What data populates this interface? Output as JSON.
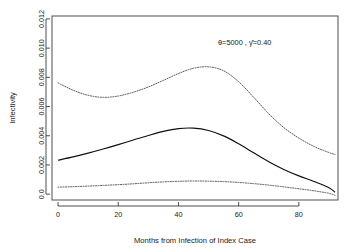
{
  "chart_data": {
    "type": "line",
    "title": "",
    "xlabel": "Months from Infection of Index Case",
    "ylabel": "Infectivity",
    "xlim": [
      -2,
      93
    ],
    "ylim": [
      -0.0004,
      0.0122
    ],
    "grid": false,
    "legend": "none",
    "xticks": [
      0,
      20,
      40,
      60,
      80
    ],
    "xtick_labels": [
      "0",
      "20",
      "40",
      "60",
      "80"
    ],
    "yticks": [
      0.0,
      0.002,
      0.004,
      0.006,
      0.008,
      0.01,
      0.012
    ],
    "ytick_labels": [
      "0.0",
      "0.002",
      "0.004",
      "0.006",
      "0.008",
      "0.010",
      "0.012"
    ],
    "annotations": [
      {
        "text": "θ=5000 ,  γ̂=0.40",
        "x": 62,
        "y": 0.0102
      }
    ],
    "series": [
      {
        "name": "upper confidence band",
        "style": "dotted",
        "x": [
          0,
          5,
          10,
          15,
          20,
          25,
          30,
          35,
          40,
          45,
          50,
          55,
          60,
          65,
          70,
          75,
          80,
          85,
          90,
          92
        ],
        "values": [
          0.00762,
          0.00712,
          0.00677,
          0.00663,
          0.00672,
          0.00698,
          0.00734,
          0.00779,
          0.00826,
          0.00862,
          0.00872,
          0.00845,
          0.0077,
          0.00663,
          0.00551,
          0.00456,
          0.00384,
          0.00327,
          0.00285,
          0.00272
        ]
      },
      {
        "name": "estimated infectivity",
        "style": "solid",
        "x": [
          0,
          5,
          10,
          15,
          20,
          25,
          30,
          35,
          40,
          45,
          50,
          55,
          60,
          65,
          70,
          75,
          80,
          85,
          90,
          92
        ],
        "values": [
          0.00232,
          0.00255,
          0.00281,
          0.00309,
          0.00339,
          0.00371,
          0.00402,
          0.0043,
          0.00449,
          0.00452,
          0.00436,
          0.00399,
          0.00345,
          0.00283,
          0.00222,
          0.00169,
          0.00125,
          0.00087,
          0.00044,
          0.00013
        ]
      },
      {
        "name": "lower confidence band",
        "style": "dotted",
        "x": [
          0,
          5,
          10,
          15,
          20,
          25,
          30,
          35,
          40,
          45,
          50,
          55,
          60,
          65,
          70,
          75,
          80,
          85,
          90,
          92
        ],
        "values": [
          0.00048,
          0.00051,
          0.00055,
          0.0006,
          0.00065,
          0.00071,
          0.00078,
          0.00084,
          0.00088,
          0.0009,
          0.00089,
          0.00086,
          0.0008,
          0.00072,
          0.00062,
          0.0005,
          0.00037,
          0.00023,
          6e-05,
          -8e-05
        ]
      }
    ]
  }
}
